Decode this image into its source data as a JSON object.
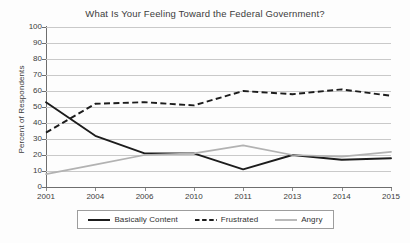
{
  "chart_data": {
    "type": "line",
    "title": "What Is Your Feeling Toward the Federal Government?",
    "xlabel": "",
    "ylabel": "Percent of Respondents",
    "categories": [
      "2001",
      "2004",
      "2006",
      "2010",
      "2011",
      "2013",
      "2014",
      "2015"
    ],
    "ylim": [
      0,
      100
    ],
    "ytick_labels": [
      "100",
      "90",
      "80",
      "70",
      "60",
      "50",
      "40",
      "30",
      "20",
      "10",
      "0"
    ],
    "ytick_values": [
      100,
      90,
      80,
      70,
      60,
      50,
      40,
      30,
      20,
      10,
      0
    ],
    "ytick_step": 10,
    "grid": "horizontal",
    "legend_position": "bottom",
    "series": [
      {
        "name": "Basically Content",
        "values": [
          53,
          32,
          21,
          21,
          11,
          20,
          17,
          18
        ],
        "color": "#1c1c1c",
        "style": "solid"
      },
      {
        "name": "Frustrated",
        "values": [
          34,
          52,
          53,
          51,
          60,
          58,
          61,
          57
        ],
        "color": "#1c1c1c",
        "style": "dashed"
      },
      {
        "name": "Angry",
        "values": [
          8,
          14,
          20,
          21,
          26,
          20,
          19,
          22
        ],
        "color": "#b2b2b2",
        "style": "solid"
      }
    ]
  },
  "legend": {
    "items": [
      {
        "label": "Basically Content"
      },
      {
        "label": "Frustrated"
      },
      {
        "label": "Angry"
      }
    ]
  }
}
